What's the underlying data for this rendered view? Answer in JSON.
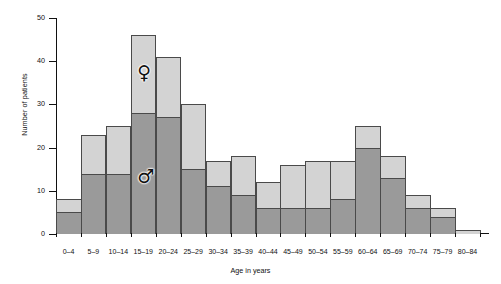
{
  "chart_data": {
    "type": "bar",
    "title": "",
    "subtitle": "",
    "xlabel": "Age in years",
    "ylabel": "Number of patients",
    "categories": [
      "0-4",
      "5-9",
      "10-14",
      "15-19",
      "20-24",
      "25-29",
      "30-34",
      "35-39",
      "40-44",
      "45-49",
      "50-54",
      "55-59",
      "60-64",
      "65-69",
      "70-74",
      "75-79",
      "80-84"
    ],
    "stacked": true,
    "ylim": [
      0,
      50
    ],
    "yticks": [
      0,
      10,
      20,
      30,
      40,
      50
    ],
    "ytick_labels": [
      "0",
      "10",
      "20",
      "30",
      "40",
      "50"
    ],
    "grid": false,
    "legend_position": "inside-plot",
    "series": [
      {
        "name": "male",
        "symbol": "♂",
        "color": "#9a9a9a",
        "values": [
          5,
          14,
          14,
          28,
          27,
          15,
          11,
          9,
          6,
          6,
          6,
          8,
          20,
          13,
          6,
          4,
          0
        ]
      },
      {
        "name": "female",
        "symbol": "♀",
        "color": "#d3d3d3",
        "values": [
          3,
          9,
          11,
          18,
          14,
          15,
          6,
          9,
          6,
          10,
          11,
          9,
          5,
          5,
          3,
          2,
          1
        ]
      }
    ],
    "totals": [
      8,
      23,
      25,
      46,
      41,
      30,
      17,
      18,
      12,
      16,
      17,
      17,
      25,
      18,
      9,
      6,
      1
    ],
    "annotations": [
      {
        "name": "female-symbol",
        "symbol": "♀",
        "x_category": "15-19",
        "y_value": 37
      },
      {
        "name": "male-symbol",
        "symbol": "♂",
        "x_category": "15-19",
        "y_value": 13
      }
    ]
  },
  "colors": {
    "female_fill": "#d3d3d3",
    "male_fill": "#9a9a9a",
    "bar_edge": "#4a4a4a",
    "axis": "#111111",
    "background": "#ffffff"
  }
}
